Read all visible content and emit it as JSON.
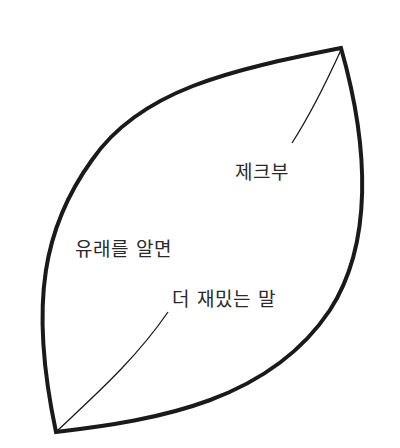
{
  "diagram": {
    "shape": "leaf",
    "stroke_color": "#1a1a1a",
    "background": "#ffffff",
    "labels": {
      "top": "제크부",
      "main_line1": "유래를 알면",
      "main_line2": "더 재밌는 말"
    }
  }
}
